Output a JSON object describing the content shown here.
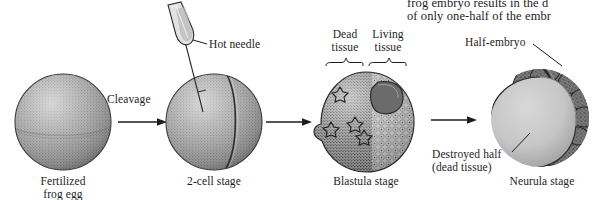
{
  "figure": {
    "title_caption": {
      "line1": "frog embryo results in the d",
      "line2": "of only one-half of the embr"
    },
    "background_color": "#ffffff",
    "ink_color": "#1d1d1d",
    "stages": [
      {
        "id": "fertilized-egg",
        "label_line1": "Fertilized",
        "label_line2": "frog egg",
        "description": "uniformly stippled grey sphere"
      },
      {
        "id": "two-cell-stage",
        "label_line1": "2-cell stage",
        "label_line2": "",
        "description": "grey sphere with vertical cleavage furrow and inserted needle"
      },
      {
        "id": "blastula-stage",
        "label_line1": "Blastula stage",
        "label_line2": "",
        "description": "sphere, left half dead stippled tissue, right half living cells, dark blastocoel"
      },
      {
        "id": "neurula-stage",
        "label_line1": "Neurula stage",
        "label_line2": "",
        "description": "light destroyed half sphere with dark lumpy half-embryo on right"
      }
    ],
    "arrows": [
      {
        "id": "arrow-cleavage",
        "label": "Cleavage"
      },
      {
        "id": "arrow-two-to-blastula",
        "label": ""
      },
      {
        "id": "arrow-blastula-to-neurula",
        "label": ""
      }
    ],
    "callouts": {
      "hot_needle": "Hot needle",
      "dead_tissue_line1": "Dead",
      "dead_tissue_line2": "tissue",
      "living_tissue_line1": "Living",
      "living_tissue_line2": "tissue",
      "half_embryo": "Half-embryo",
      "destroyed_half_line1": "Destroyed half",
      "destroyed_half_line2": "(dead tissue)"
    }
  }
}
